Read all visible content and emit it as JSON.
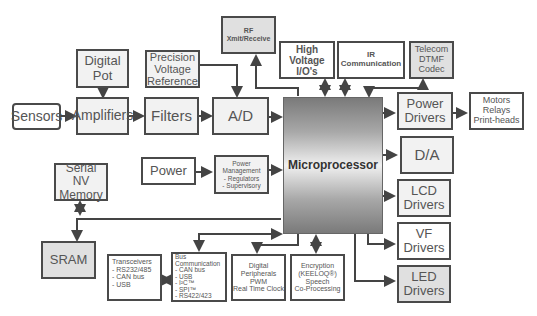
{
  "diagram": {
    "type": "block-diagram",
    "center": "Microprocessor",
    "blocks": {
      "sensors": "Sensors",
      "digital_pot": "Digital\nPot",
      "amplifiers": "Amplifiers",
      "precision_ref": "Precision\nVoltage\nReference",
      "filters": "Filters",
      "ad": "A/D",
      "rf": "RF\nXmit/Receive",
      "high_voltage": "High\nVoltage\nI/O's",
      "ir": "IR\nCommunication",
      "telecom": "Telecom\nDTMF\nCodec",
      "power_drivers": "Power\nDrivers",
      "motors": "Motors\nRelays\nPrint-heads",
      "microprocessor": "Microprocessor",
      "da": "D/A",
      "lcd": "LCD\nDrivers",
      "vf": "VF\nDrivers",
      "led": "LED\nDrivers",
      "serial_nv": "Serial NV\nMemory",
      "power": "Power",
      "power_mgmt": "Power\nManagement\n- Regulators\n- Supervisory",
      "sram": "SRAM",
      "transceivers": "Transceivers\n- RS232/485\n-  CAN bus\n-  USB",
      "bus_comm": "Bus\nCommunication\n- CAN bus\n- USB\n- I²C™\n- SPI™\n- RS422/423",
      "digital_periph": "Digital\nPeripherals\nPWM\nReal Time Clock",
      "encryption": "Encryption\n(KEELOQ®)\nSpeech\nCo-Processing"
    },
    "connections": [
      [
        "Sensors",
        "Amplifiers"
      ],
      [
        "Digital Pot",
        "Amplifiers"
      ],
      [
        "Amplifiers",
        "Filters"
      ],
      [
        "Filters",
        "A/D"
      ],
      [
        "Precision Voltage Reference",
        "A/D"
      ],
      [
        "A/D",
        "Microprocessor"
      ],
      [
        "Microprocessor",
        "RF Xmit/Receive"
      ],
      [
        "High Voltage I/O's",
        "Microprocessor",
        "bidirectional"
      ],
      [
        "IR Communication",
        "Microprocessor",
        "bidirectional"
      ],
      [
        "Telecom DTMF Codec",
        "Microprocessor",
        "bidirectional"
      ],
      [
        "Microprocessor",
        "Power Drivers"
      ],
      [
        "Power Drivers",
        "Motors Relays Print-heads"
      ],
      [
        "Microprocessor",
        "D/A"
      ],
      [
        "Microprocessor",
        "LCD Drivers"
      ],
      [
        "Microprocessor",
        "VF Drivers"
      ],
      [
        "Microprocessor",
        "LED Drivers"
      ],
      [
        "Power",
        "Power Management"
      ],
      [
        "Power Management",
        "Microprocessor"
      ],
      [
        "Serial NV Memory",
        "SRAM/Microprocessor bus",
        "bidirectional"
      ],
      [
        "Microprocessor",
        "SRAM"
      ],
      [
        "Microprocessor",
        "Bus Communication",
        "bidirectional"
      ],
      [
        "Transceivers",
        "Bus Communication",
        "bidirectional"
      ],
      [
        "Microprocessor",
        "Digital Peripherals"
      ],
      [
        "Encryption",
        "Microprocessor",
        "bidirectional"
      ]
    ]
  }
}
